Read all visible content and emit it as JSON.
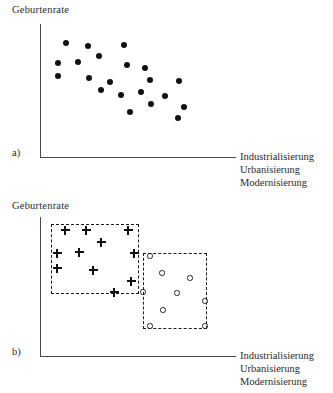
{
  "figure": {
    "caption_language": "de",
    "background": "#ffffff",
    "ink": "#111111",
    "axis_color": "#4a4a4a"
  },
  "chart_data": [
    {
      "id": "panel-a",
      "type": "scatter",
      "title": "",
      "panel_label": "a)",
      "ylabel": "Geburtenrate",
      "xlabel": "Industrialisierung Urbanisierung Modernisierung",
      "xlabel_lines": [
        "Industrialisierung",
        "Urbanisierung",
        "Modernisierung"
      ],
      "grid": false,
      "legend": "none",
      "xlim": [
        0,
        100
      ],
      "ylim": [
        0,
        100
      ],
      "axis_ticks": "none",
      "description": "Negativer Zusammenhang: Geburtenrate sinkt mit steigender Industrialisierung",
      "series": [
        {
          "name": "Laender",
          "marker": "filled-circle",
          "color": "#111111",
          "points": [
            {
              "x": 12.5,
              "y": 89.5
            },
            {
              "x": 25.5,
              "y": 86.5
            },
            {
              "x": 46.5,
              "y": 87.5
            },
            {
              "x": 32.0,
              "y": 79.0
            },
            {
              "x": 7.5,
              "y": 73.0
            },
            {
              "x": 19.5,
              "y": 73.5
            },
            {
              "x": 48.5,
              "y": 71.5
            },
            {
              "x": 59.0,
              "y": 68.5
            },
            {
              "x": 7.5,
              "y": 62.5
            },
            {
              "x": 26.0,
              "y": 61.0
            },
            {
              "x": 38.5,
              "y": 57.5
            },
            {
              "x": 61.5,
              "y": 59.0
            },
            {
              "x": 79.0,
              "y": 58.0
            },
            {
              "x": 33.0,
              "y": 51.0
            },
            {
              "x": 44.5,
              "y": 47.0
            },
            {
              "x": 56.5,
              "y": 49.0
            },
            {
              "x": 70.5,
              "y": 45.5
            },
            {
              "x": 81.5,
              "y": 37.0
            },
            {
              "x": 50.0,
              "y": 33.0
            },
            {
              "x": 62.5,
              "y": 39.5
            },
            {
              "x": 78.5,
              "y": 27.5
            }
          ]
        }
      ]
    },
    {
      "id": "panel-b",
      "type": "scatter",
      "title": "",
      "panel_label": "b)",
      "ylabel": "Geburtenrate",
      "xlabel": "Industrialisierung Urbanisierung Modernisierung",
      "xlabel_lines": [
        "Industrialisierung",
        "Urbanisierung",
        "Modernisierung"
      ],
      "grid": false,
      "legend": "none",
      "xlim": [
        0,
        100
      ],
      "ylim": [
        0,
        100
      ],
      "axis_ticks": "none",
      "description": "Zwei Gruppen: Kreuze (Gruppe 1, hohe Geburtenrate) und Kreise (Gruppe 2, niedrige Geburtenrate), jeweils umrahmt von gestricheltem Kasten",
      "annotations": [
        {
          "kind": "dashed-box",
          "name": "cluster-box-plus",
          "x": 51,
          "y": 224,
          "w": 88,
          "h": 70
        },
        {
          "kind": "dashed-box",
          "name": "cluster-box-circle",
          "x": 143,
          "y": 253,
          "w": 64,
          "h": 76
        }
      ],
      "series": [
        {
          "name": "Gruppe 1",
          "marker": "plus",
          "color": "#111111",
          "points": [
            {
              "x": 65,
              "y": 230
            },
            {
              "x": 86,
              "y": 230
            },
            {
              "x": 128,
              "y": 230
            },
            {
              "x": 101,
              "y": 242
            },
            {
              "x": 57,
              "y": 253
            },
            {
              "x": 79,
              "y": 252
            },
            {
              "x": 134,
              "y": 253
            },
            {
              "x": 57,
              "y": 268
            },
            {
              "x": 93,
              "y": 270
            },
            {
              "x": 131,
              "y": 281
            },
            {
              "x": 114,
              "y": 292
            }
          ]
        },
        {
          "name": "Gruppe 2",
          "marker": "open-circle",
          "color": "#222222",
          "points": [
            {
              "x": 150,
              "y": 256
            },
            {
              "x": 162,
              "y": 273
            },
            {
              "x": 190,
              "y": 278
            },
            {
              "x": 143,
              "y": 292
            },
            {
              "x": 177,
              "y": 293
            },
            {
              "x": 163,
              "y": 310
            },
            {
              "x": 205,
              "y": 301
            },
            {
              "x": 150,
              "y": 326
            },
            {
              "x": 205,
              "y": 326
            }
          ]
        }
      ]
    }
  ],
  "panel_a": {
    "tag": "a)",
    "ylabel": "Geburtenrate",
    "xlabel_line1": "Industrialisierung",
    "xlabel_line2": "Urbanisierung",
    "xlabel_line3": "Modernisierung"
  },
  "panel_b": {
    "tag": "b)",
    "ylabel": "Geburtenrate",
    "xlabel_line1": "Industrialisierung",
    "xlabel_line2": "Urbanisierung",
    "xlabel_line3": "Modernisierung"
  }
}
